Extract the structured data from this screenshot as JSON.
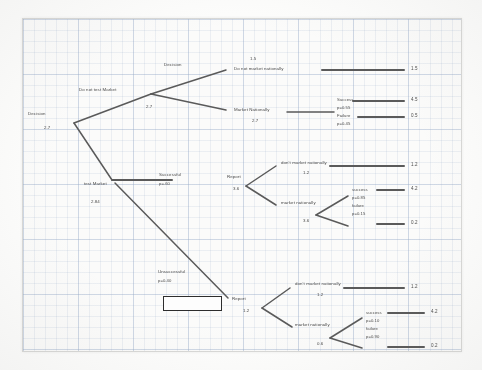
{
  "diagram": {
    "type": "decision-tree",
    "ink_color": "#5a5a5a",
    "box_color": "#2d2d2d"
  },
  "root": {
    "label": "Decision",
    "value": "2.7"
  },
  "branch_no_test": {
    "label": "Do not test Market",
    "value": "2.7",
    "decision_label": "Decision",
    "options": [
      {
        "name": "Do not market nationally",
        "value": "1.5",
        "payoff": "1.5"
      },
      {
        "name": "Market Nationally",
        "value": "2.7",
        "outcomes": [
          {
            "name": "Success",
            "prob": "p=0.55",
            "payoff": "4.5"
          },
          {
            "name": "Failure",
            "prob": "p=0.45",
            "payoff": "0.5"
          }
        ]
      }
    ]
  },
  "branch_test": {
    "label": "test Market",
    "value": "2.84",
    "results": [
      {
        "name": "Successful",
        "prob": "p=.60",
        "report_label": "Report",
        "report_value": "3.6",
        "options": [
          {
            "name": "don't market nationally",
            "value": "1.2",
            "payoff": "1.2"
          },
          {
            "name": "market nationally",
            "value": "3.6",
            "outcomes": [
              {
                "name": "success",
                "prob": "p=0.85",
                "payoff": "4.2"
              },
              {
                "name": "failure",
                "prob": "p=0.15",
                "payoff": "0.2"
              }
            ]
          }
        ]
      },
      {
        "name": "Unsuccessful",
        "prob": "p=0.40",
        "report_label": "Report",
        "report_value": "1.2",
        "options": [
          {
            "name": "don't market nationally",
            "value": "1.2",
            "payoff": "1.2"
          },
          {
            "name": "market nationally",
            "value": "0.6",
            "outcomes": [
              {
                "name": "success",
                "prob": "p=0.10",
                "payoff": "4.2"
              },
              {
                "name": "failure",
                "prob": "p=0.90",
                "payoff": "0.2"
              }
            ]
          }
        ]
      }
    ]
  }
}
